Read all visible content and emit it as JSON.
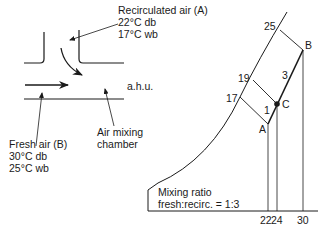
{
  "ahu_schematic": {
    "recirculated_air": {
      "title": "Recirculated air (A)",
      "db": "22°C db",
      "wb": "17°C wb"
    },
    "fresh_air": {
      "title": "Fresh air (B)",
      "db": "30°C db",
      "wb": "25°C wb"
    },
    "ahu_label": "a.h.u.",
    "mixing_chamber": {
      "line1": "Air mixing",
      "line2": "chamber"
    }
  },
  "psychrometric_chart": {
    "wb_labels": [
      "25",
      "19",
      "17"
    ],
    "points": {
      "A": "A",
      "B": "B",
      "C": "C"
    },
    "segment_ratios": {
      "AC": "1",
      "CB": "3"
    },
    "db_axis_ticks": [
      "22",
      "24",
      "30"
    ],
    "note": {
      "line1": "Mixing ratio",
      "line2": "fresh:recirc. = 1:3"
    }
  },
  "colors": {
    "line": "#1a1a1a",
    "background": "#ffffff"
  }
}
